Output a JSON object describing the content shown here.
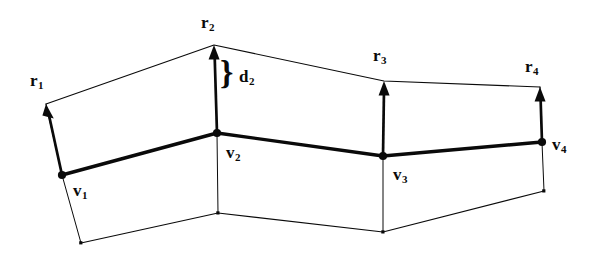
{
  "figure": {
    "background_color": "#ffffff",
    "ink_color": "#0a0a0a"
  },
  "labels": {
    "r1": {
      "base": "r",
      "sub": "1",
      "x": 30,
      "y": 72
    },
    "r2": {
      "base": "r",
      "sub": "2",
      "x": 201,
      "y": 14
    },
    "r3": {
      "base": "r",
      "sub": "3",
      "x": 373,
      "y": 47
    },
    "r4": {
      "base": "r",
      "sub": "4",
      "x": 525,
      "y": 58
    },
    "v1": {
      "base": "v",
      "sub": "1",
      "x": 73,
      "y": 182
    },
    "v2": {
      "base": "v",
      "sub": "2",
      "x": 226,
      "y": 144
    },
    "v3": {
      "base": "v",
      "sub": "3",
      "x": 393,
      "y": 166
    },
    "v4": {
      "base": "v",
      "sub": "4",
      "x": 552,
      "y": 136
    },
    "d2": {
      "base": "d",
      "sub": "2",
      "x": 239,
      "y": 68
    },
    "brace": {
      "glyph": "}",
      "x": 220,
      "y": 56
    }
  },
  "geometry": {
    "vertices_bold": [
      {
        "name": "v1",
        "x": 62,
        "y": 175
      },
      {
        "name": "v2",
        "x": 217,
        "y": 133
      },
      {
        "name": "v3",
        "x": 383,
        "y": 156
      },
      {
        "name": "v4",
        "x": 542,
        "y": 142
      }
    ],
    "vector_tips": [
      {
        "name": "r1",
        "x": 46,
        "y": 104
      },
      {
        "name": "r2",
        "x": 214,
        "y": 45
      },
      {
        "name": "r3",
        "x": 384,
        "y": 81
      },
      {
        "name": "r4",
        "x": 540,
        "y": 87
      }
    ],
    "bottom_points": [
      {
        "name": "b1",
        "x": 81,
        "y": 243
      },
      {
        "name": "b2",
        "x": 218,
        "y": 213
      },
      {
        "name": "b3",
        "x": 383,
        "y": 232
      },
      {
        "name": "b4",
        "x": 544,
        "y": 191
      }
    ],
    "top_polyline": "46,104 214,45 384,81 540,87",
    "bold_polyline": "62,175 217,133 383,156 542,142",
    "bottom_polyline": "81,243 218,213 383,232 544,191",
    "thin_stroke_width": 1.1,
    "bold_stroke_width": 3.4,
    "vector_stroke_width": 2.6
  }
}
